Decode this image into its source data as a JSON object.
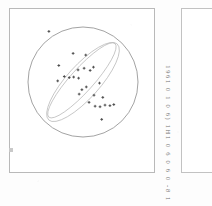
{
  "figure": {
    "panel_label": "stereonet-plot",
    "frame_color": "#b9b9b9",
    "point_color": "#4a4a4a",
    "primitive_color": "#8c8c8c",
    "girdle_color": "#b5b5b5"
  },
  "caption": {
    "line1": "1961 0 1 0 6) 1H1 0 6 0 6 0 -8 1",
    "text_color": "#6f6f6f"
  },
  "right_panel": {
    "label": "",
    "border_color": "#c2c2c2"
  },
  "chart_data": {
    "type": "scatter",
    "title": "",
    "xlabel": "",
    "ylabel": "",
    "projection": "equal-area stereonet",
    "xlim": [
      -1,
      1
    ],
    "ylim": [
      -1,
      1
    ],
    "grid": false,
    "legend": "none",
    "primitive_circle": {
      "center_x": 0.0,
      "center_y": 0.0,
      "radius": 1.0
    },
    "girdles": [
      {
        "name": "great-circle-upper",
        "cx": 0.0,
        "cy": 0.0,
        "rx": 0.93,
        "ry": 0.3,
        "rotation_deg": -48
      },
      {
        "name": "great-circle-lower",
        "cx": -0.02,
        "cy": 0.03,
        "rx": 0.9,
        "ry": 0.21,
        "rotation_deg": -48
      }
    ],
    "points": [
      {
        "x": -0.62,
        "y": 0.92
      },
      {
        "x": -0.18,
        "y": 0.52
      },
      {
        "x": 0.05,
        "y": 0.49
      },
      {
        "x": -0.44,
        "y": 0.3
      },
      {
        "x": -0.09,
        "y": 0.22
      },
      {
        "x": 0.02,
        "y": 0.25
      },
      {
        "x": 0.13,
        "y": 0.21
      },
      {
        "x": 0.19,
        "y": 0.27
      },
      {
        "x": -0.34,
        "y": 0.1
      },
      {
        "x": -0.25,
        "y": 0.08
      },
      {
        "x": -0.17,
        "y": 0.09
      },
      {
        "x": -0.08,
        "y": 0.07
      },
      {
        "x": -0.46,
        "y": 0.02
      },
      {
        "x": 0.3,
        "y": -0.02
      },
      {
        "x": 0.06,
        "y": -0.09
      },
      {
        "x": -0.02,
        "y": -0.14
      },
      {
        "x": -0.07,
        "y": -0.22
      },
      {
        "x": 0.2,
        "y": -0.24
      },
      {
        "x": 0.36,
        "y": -0.28
      },
      {
        "x": 0.11,
        "y": -0.37
      },
      {
        "x": 0.22,
        "y": -0.44
      },
      {
        "x": 0.31,
        "y": -0.45
      },
      {
        "x": 0.4,
        "y": -0.42
      },
      {
        "x": 0.49,
        "y": -0.43
      },
      {
        "x": 0.56,
        "y": -0.41
      },
      {
        "x": 0.34,
        "y": -0.68
      }
    ]
  }
}
